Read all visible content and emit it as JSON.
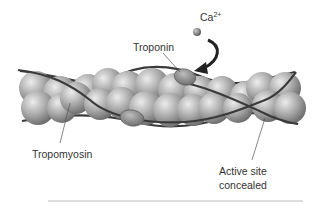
{
  "diagram": {
    "labels": {
      "calcium": "Ca",
      "calcium_charge": "2+",
      "troponin": "Troponin",
      "tropomyosin": "Tropomyosin",
      "active_site_line1": "Active site",
      "active_site_line2": "concealed"
    },
    "colors": {
      "actin_bead": "#a8a8a8",
      "actin_highlight": "#e6e6e6",
      "actin_shadow": "#7a7a7a",
      "troponin": "#8c8c8c",
      "tropomyosin_strand": "#3a3a3a",
      "arrow": "#222222",
      "text": "#333333",
      "rule": "#bdbdbd"
    }
  }
}
